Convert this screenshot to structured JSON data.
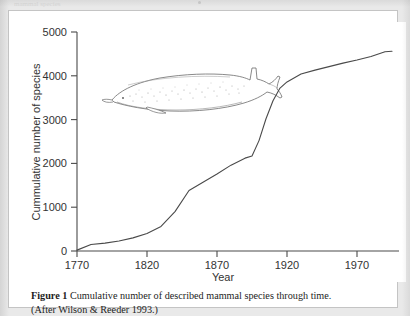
{
  "page": {
    "background_color": "#e9e9e9",
    "panel_color": "#ffffff",
    "panel_border_color": "#c4c4c4",
    "bleed_text": "mammal species"
  },
  "caption": {
    "label": "Figure 1",
    "line1": "Cumulative number of described mammal species through time.",
    "line2": "(After Wilson & Reeder 1993.)"
  },
  "illustration": {
    "name": "beaked-whale-line-drawing",
    "outline_color": "#6b6b6b",
    "stipple_color": "#9a9a9a"
  },
  "chart_data": {
    "type": "line",
    "title": "",
    "xlabel": "Year",
    "ylabel": "Cummulative number of species",
    "xlim": [
      1770,
      2000
    ],
    "ylim": [
      0,
      5000
    ],
    "xticks": [
      1770,
      1820,
      1870,
      1920,
      1970
    ],
    "xtick_labels": [
      "1770",
      "1820",
      "1870",
      "1920",
      "1970"
    ],
    "yticks": [
      0,
      1000,
      2000,
      3000,
      4000,
      5000
    ],
    "ytick_labels": [
      "0",
      "1000",
      "2000",
      "3000",
      "4000",
      "5000"
    ],
    "grid": false,
    "legend": "none",
    "line_color": "#4a4a4a",
    "series": [
      {
        "name": "Cumulative described mammal species",
        "x": [
          1770,
          1780,
          1790,
          1800,
          1810,
          1820,
          1830,
          1840,
          1850,
          1860,
          1870,
          1880,
          1890,
          1895,
          1900,
          1905,
          1910,
          1915,
          1920,
          1930,
          1940,
          1950,
          1960,
          1970,
          1980,
          1990,
          1995
        ],
        "values": [
          20,
          150,
          180,
          230,
          300,
          400,
          560,
          900,
          1380,
          1570,
          1760,
          1960,
          2120,
          2170,
          2520,
          3020,
          3430,
          3720,
          3860,
          4040,
          4130,
          4210,
          4290,
          4360,
          4440,
          4550,
          4560
        ]
      }
    ]
  }
}
